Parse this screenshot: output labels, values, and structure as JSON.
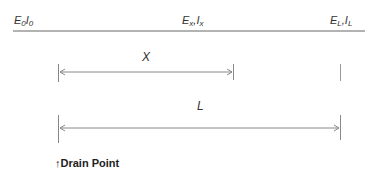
{
  "diagram": {
    "top_line_labels": [
      {
        "main": "E",
        "sub": "0",
        "sep": "",
        "main2": "I",
        "sub2": "0"
      },
      {
        "main": "E",
        "sub": "x",
        "sep": ",",
        "main2": "I",
        "sub2": "x"
      },
      {
        "main": "E",
        "sub": "L",
        "sep": ",",
        "main2": "I",
        "sub2": "L"
      }
    ],
    "dimension_x_label": "X",
    "dimension_l_label": "L",
    "drain_point": {
      "arrow": "↑",
      "label": "Drain Point"
    },
    "colors": {
      "line": "#555555",
      "dimension": "#888888",
      "text": "#333333"
    }
  }
}
